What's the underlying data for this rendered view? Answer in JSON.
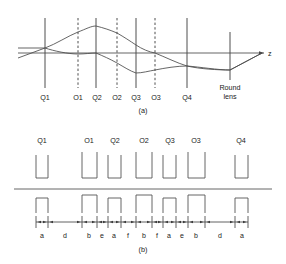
{
  "figure": {
    "caption_a": "(a)",
    "caption_b": "(b)",
    "axis_label": "z",
    "round_lens_line1": "Round",
    "round_lens_line2": "lens"
  },
  "panel_a": {
    "elements": [
      {
        "id": "Q1",
        "label": "Q1",
        "x": 45,
        "style": "solid",
        "top": 18,
        "bottom": 88
      },
      {
        "id": "O1",
        "label": "O1",
        "x": 78,
        "style": "dashed",
        "top": 18,
        "bottom": 88
      },
      {
        "id": "Q2",
        "label": "Q2",
        "x": 96,
        "style": "solid",
        "top": 18,
        "bottom": 88
      },
      {
        "id": "O2",
        "label": "O2",
        "x": 117,
        "style": "dashed",
        "top": 18,
        "bottom": 88
      },
      {
        "id": "Q3",
        "label": "Q3",
        "x": 136,
        "style": "solid",
        "top": 18,
        "bottom": 88
      },
      {
        "id": "O3",
        "label": "O3",
        "x": 155,
        "style": "dashed",
        "top": 18,
        "bottom": 88
      },
      {
        "id": "Q4",
        "label": "Q4",
        "x": 187,
        "style": "solid",
        "top": 18,
        "bottom": 88
      },
      {
        "id": "RoundLens",
        "label": "Round lens",
        "x": 230,
        "style": "solid",
        "top": 32,
        "bottom": 80
      }
    ],
    "axis_y": 53,
    "axis_x_start": 18,
    "axis_x_end": 266,
    "ray_upper": "M18,48 L45,48 L78,32 L96,26 L117,33 L136,45 L155,53 L187,66 L230,70 L262,53",
    "ray_lower": "M18,58 L45,48 L78,54 L96,53 L117,63 L136,73 L155,70 L187,66 L230,70 L262,53",
    "ray_center": "M18,53 L262,53"
  },
  "panel_b": {
    "axis_y": 189,
    "baseline_x_start": 14,
    "baseline_x_end": 272,
    "tick_row_y": 218,
    "labels": [
      {
        "id": "Q1",
        "label": "Q1",
        "x": 40
      },
      {
        "id": "O1",
        "label": "O1",
        "x": 87
      },
      {
        "id": "Q2",
        "label": "Q2",
        "x": 114
      },
      {
        "id": "O2",
        "label": "O2",
        "x": 143
      },
      {
        "id": "Q3",
        "label": "Q3",
        "x": 171
      },
      {
        "id": "O3",
        "label": "O3",
        "x": 196
      },
      {
        "id": "Q4",
        "label": "Q4",
        "x": 240
      }
    ],
    "poles": [
      {
        "id": "Q1",
        "x_left": 36,
        "x_right": 48
      },
      {
        "id": "O1",
        "x_left": 82,
        "x_right": 97
      },
      {
        "id": "Q2",
        "x_left": 108,
        "x_right": 121
      },
      {
        "id": "O2",
        "x_left": 136,
        "x_right": 152
      },
      {
        "id": "Q3",
        "x_left": 163,
        "x_right": 176
      },
      {
        "id": "O3",
        "x_left": 188,
        "x_right": 205
      },
      {
        "id": "Q4",
        "x_left": 235,
        "x_right": 248
      }
    ],
    "upper_box_top": 163,
    "lower_box_bottom": 213,
    "dimension_labels": [
      "a",
      "d",
      "b",
      "e",
      "a",
      "f",
      "b",
      "f",
      "a",
      "e",
      "b",
      "d",
      "a"
    ],
    "dimension_boundaries": [
      36,
      48,
      82,
      97,
      108,
      121,
      136,
      152,
      163,
      176,
      188,
      205,
      235,
      248
    ]
  },
  "colors": {
    "ink": "#3a3a3a",
    "ray": "#4a4a4a",
    "box": "#555555",
    "background": "#ffffff"
  }
}
